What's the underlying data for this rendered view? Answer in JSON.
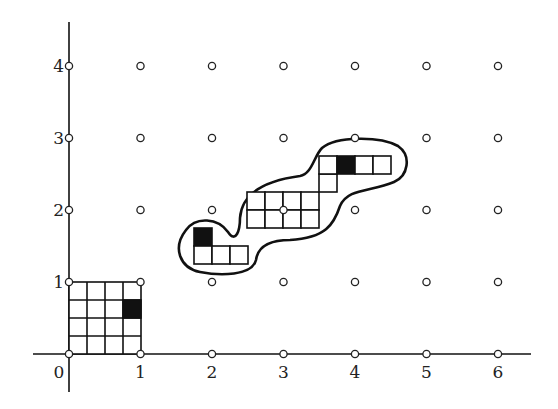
{
  "diagram": {
    "type": "lattice-tiling",
    "origin_px": [
      69,
      354
    ],
    "unit_px": [
      71.5,
      72
    ],
    "x_axis": {
      "range": [
        0,
        6
      ],
      "tick_labels": [
        "0",
        "1",
        "2",
        "3",
        "4",
        "5",
        "6"
      ]
    },
    "y_axis": {
      "range": [
        0,
        4
      ],
      "tick_labels": [
        "1",
        "2",
        "3",
        "4"
      ]
    },
    "lattice_points": "all integer points (x in 0..6, y in 0..4) drawn as small open circles",
    "unit_square": {
      "description": "4x4 subdivision of the unit square [0,1]x[0,1]",
      "subdivision": 4,
      "filled_cell": {
        "col": 3,
        "row_from_top": 1
      }
    },
    "blob_region": {
      "description": "closed curve enclosing a translated set of subcells",
      "groups": [
        {
          "name": "left",
          "cells": [
            {
              "x": 1.75,
              "y": 1.5,
              "filled": true
            },
            {
              "x": 1.75,
              "y": 1.25
            },
            {
              "x": 2.0,
              "y": 1.25
            },
            {
              "x": 2.25,
              "y": 1.25
            }
          ]
        },
        {
          "name": "middle",
          "cells": "4x2 block from x=2.5 to 3.5, y=1.75 to 2.25, centered on lattice point (3,2)"
        },
        {
          "name": "connector",
          "cells": [
            {
              "x": 3.5,
              "y": 2.25
            },
            {
              "x": 3.5,
              "y": 2.5
            }
          ]
        },
        {
          "name": "top",
          "cells": [
            {
              "x": 3.5,
              "y": 2.5
            },
            {
              "x": 3.75,
              "y": 2.5,
              "filled": true
            },
            {
              "x": 4.0,
              "y": 2.5
            },
            {
              "x": 4.25,
              "y": 2.5
            }
          ]
        }
      ]
    }
  }
}
